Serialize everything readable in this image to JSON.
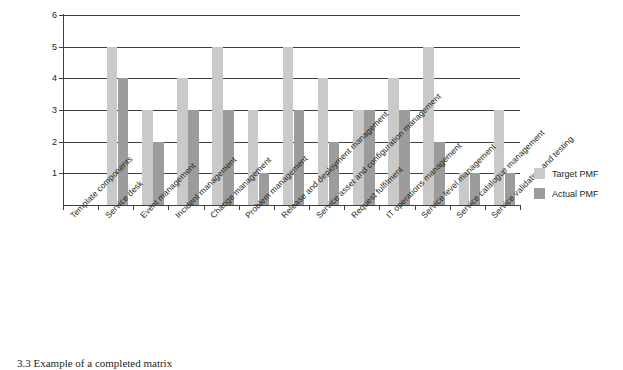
{
  "chart_data": {
    "type": "bar",
    "title": "",
    "xlabel": "",
    "ylabel": "",
    "ylim": [
      0,
      6
    ],
    "yticks": [
      1,
      2,
      3,
      4,
      5,
      6
    ],
    "grid": true,
    "legend_position": "right",
    "categories": [
      "Template components",
      "Service desk",
      "Event management",
      "Incident management",
      "Change management",
      "Problem management",
      "Release and deployment management",
      "Service asset and configuration management",
      "Request fulfilment",
      "IT operations management",
      "Service level management",
      "Service catalogue management",
      "Service validation and testing"
    ],
    "series": [
      {
        "name": "Target PMF",
        "color": "#c9c9c9",
        "values": [
          null,
          5,
          3,
          4,
          5,
          3,
          5,
          4,
          3,
          4,
          5,
          1,
          3
        ]
      },
      {
        "name": "Actual PMF",
        "color": "#9c9c9c",
        "values": [
          null,
          4,
          2,
          3,
          3,
          1,
          3,
          2,
          3,
          3,
          2,
          1,
          1
        ]
      }
    ]
  },
  "legend": {
    "items": [
      {
        "label": "Target PMF",
        "color": "#c9c9c9"
      },
      {
        "label": "Actual PMF",
        "color": "#9c9c9c"
      }
    ]
  },
  "caption": {
    "text": "3.3 Example of a completed matrix"
  }
}
